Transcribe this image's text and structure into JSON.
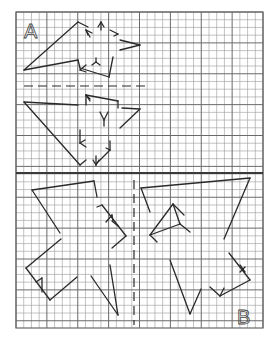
{
  "worksheet": {
    "type": "symmetry-reflection-grid",
    "grid": {
      "left": 16,
      "top": 12,
      "right": 263,
      "bottom": 328,
      "columns": 32,
      "rows": 41,
      "cell": 7.72,
      "major_every": 4,
      "minor_color": "#9a9a9a",
      "major_color": "#6a6a6a",
      "divider_y": 173,
      "divider_color": "#3a3a3a"
    },
    "ink_color": "#2a2a2a",
    "sections": [
      {
        "id": "A",
        "label": "A",
        "label_pos": [
          24,
          38
        ],
        "mirror": {
          "orientation": "horizontal",
          "x1": 24,
          "y1": 86,
          "x2": 150,
          "y2": 86,
          "style": "dashed"
        },
        "segments_upper": [
          [
            24,
            70,
            78,
            22
          ],
          [
            78,
            22,
            88,
            27
          ],
          [
            24,
            70,
            78,
            60
          ],
          [
            78,
            60,
            80,
            68
          ],
          [
            80,
            68,
            109,
            77
          ],
          [
            109,
            77,
            113,
            57
          ],
          [
            86,
            30,
            90,
            37
          ],
          [
            86,
            30,
            88,
            35
          ],
          [
            86,
            30,
            92,
            33
          ],
          [
            101,
            22,
            101,
            30
          ],
          [
            101,
            22,
            98,
            27
          ],
          [
            101,
            22,
            104,
            27
          ],
          [
            118,
            34,
            110,
            30
          ],
          [
            118,
            34,
            114,
            36
          ],
          [
            120,
            40,
            140,
            45
          ],
          [
            140,
            45,
            120,
            50
          ],
          [
            96,
            58,
            96,
            62
          ],
          [
            96,
            62,
            92,
            65
          ],
          [
            96,
            62,
            100,
            65
          ],
          [
            80,
            70,
            86,
            65
          ],
          [
            80,
            70,
            86,
            72
          ]
        ],
        "segments_lower": [
          [
            24,
            102,
            78,
            105
          ],
          [
            24,
            102,
            80,
            165
          ],
          [
            86,
            95,
            86,
            105
          ],
          [
            86,
            95,
            118,
            101
          ],
          [
            118,
            101,
            118,
            108
          ],
          [
            86,
            95,
            90,
            101
          ],
          [
            86,
            95,
            90,
            99
          ],
          [
            122,
            108,
            140,
            109
          ],
          [
            140,
            109,
            120,
            128
          ],
          [
            100,
            112,
            104,
            120
          ],
          [
            108,
            112,
            104,
            120
          ],
          [
            104,
            120,
            104,
            126
          ],
          [
            80,
            130,
            80,
            143
          ],
          [
            80,
            143,
            86,
            147
          ],
          [
            80,
            143,
            85,
            140
          ],
          [
            96,
            164,
            110,
            150
          ],
          [
            110,
            150,
            110,
            141
          ],
          [
            110,
            150,
            106,
            148
          ],
          [
            80,
            165,
            86,
            160
          ],
          [
            96,
            156,
            96,
            165
          ],
          [
            96,
            165,
            93,
            160
          ],
          [
            96,
            165,
            99,
            160
          ]
        ]
      },
      {
        "id": "B",
        "label": "B",
        "label_pos": [
          237,
          324
        ],
        "mirror": {
          "orientation": "vertical",
          "x1": 134,
          "y1": 180,
          "x2": 134,
          "y2": 325,
          "style": "dashed"
        },
        "segments_left": [
          [
            32,
            190,
            94,
            181
          ],
          [
            94,
            181,
            97,
            197
          ],
          [
            32,
            190,
            60,
            233
          ],
          [
            97,
            207,
            102,
            205
          ],
          [
            102,
            205,
            126,
            236
          ],
          [
            106,
            222,
            112,
            215
          ],
          [
            112,
            215,
            113,
            221
          ],
          [
            112,
            221,
            118,
            226
          ],
          [
            126,
            236,
            112,
            248
          ],
          [
            61,
            239,
            26,
            268
          ],
          [
            26,
            268,
            50,
            300
          ],
          [
            50,
            300,
            77,
            277
          ],
          [
            36,
            282,
            42,
            278
          ],
          [
            42,
            278,
            42,
            292
          ],
          [
            91,
            276,
            118,
            315
          ],
          [
            118,
            315,
            110,
            265
          ]
        ],
        "segments_right": [
          [
            141,
            188,
            250,
            178
          ],
          [
            250,
            178,
            224,
            239
          ],
          [
            141,
            188,
            150,
            212
          ],
          [
            150,
            235,
            173,
            204
          ],
          [
            173,
            204,
            184,
            215
          ],
          [
            173,
            204,
            180,
            224
          ],
          [
            150,
            235,
            180,
            224
          ],
          [
            180,
            224,
            190,
            232
          ],
          [
            150,
            235,
            157,
            242
          ],
          [
            229,
            253,
            250,
            280
          ],
          [
            250,
            280,
            220,
            296
          ],
          [
            240,
            265,
            245,
            272
          ],
          [
            240,
            272,
            245,
            267
          ],
          [
            220,
            296,
            210,
            287
          ],
          [
            220,
            296,
            224,
            288
          ],
          [
            170,
            260,
            190,
            314
          ],
          [
            190,
            314,
            201,
            289
          ]
        ]
      }
    ]
  }
}
